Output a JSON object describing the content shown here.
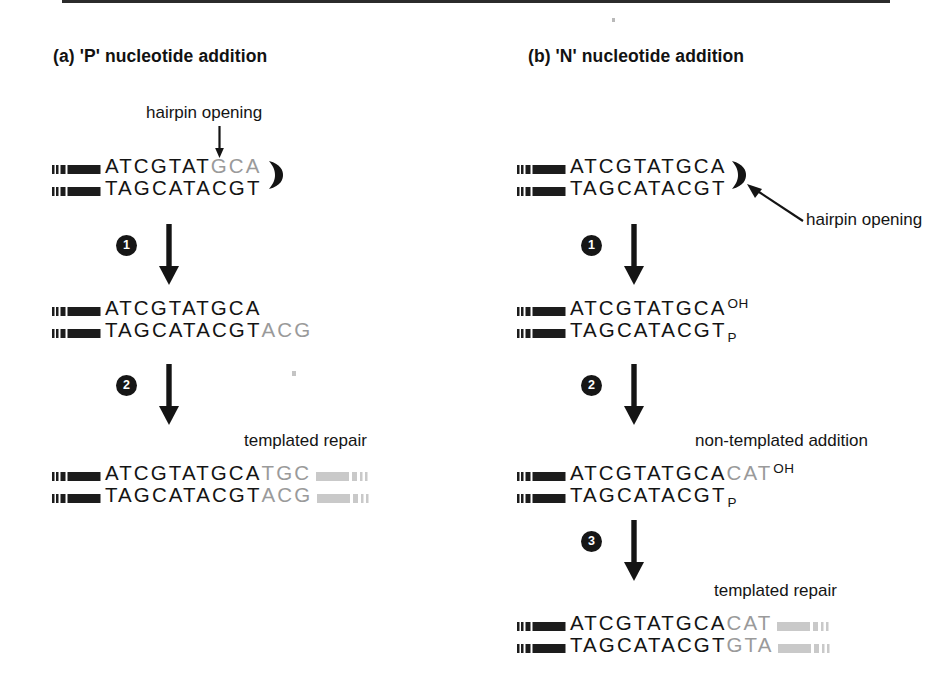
{
  "figure": {
    "background": "#ffffff",
    "ink_black": "#141414",
    "ink_gray": "#9a9a9a",
    "bar_gray": "#c9c9c9"
  },
  "panels": [
    {
      "id": "a",
      "title": "(a)  'P' nucleotide addition",
      "annotations": {
        "hairpin_opening": "hairpin opening",
        "templated_repair": "templated repair"
      },
      "steps": [
        "1",
        "2"
      ],
      "stages": [
        {
          "name": "hairpin-sealed-coding-end",
          "top": {
            "black": "ATCGTAT",
            "gray": "GCA"
          },
          "bottom": {
            "black": "TAGCATACGT",
            "gray": ""
          },
          "hairpin": true,
          "left_bar": true,
          "right_bar": false
        },
        {
          "name": "opened-hairpin-with-p-nucleotides",
          "top": {
            "black": "ATCGTATGCA",
            "gray": ""
          },
          "bottom": {
            "black": "TAGCATACGT",
            "gray": "ACG"
          },
          "hairpin": false,
          "left_bar": true,
          "right_bar": false
        },
        {
          "name": "templated-repair-product",
          "top": {
            "black": "ATCGTATGCA",
            "gray": "TGC"
          },
          "bottom": {
            "black": "TAGCATACGT",
            "gray": "ACG"
          },
          "hairpin": false,
          "left_bar": true,
          "right_bar": true
        }
      ]
    },
    {
      "id": "b",
      "title": "(b)  'N' nucleotide addition",
      "annotations": {
        "hairpin_opening": "hairpin opening",
        "non_templated_addition": "non-templated addition",
        "templated_repair": "templated repair"
      },
      "steps": [
        "1",
        "2",
        "3"
      ],
      "stages": [
        {
          "name": "hairpin-sealed-coding-end",
          "top": {
            "black": "ATCGTATGCA",
            "gray": ""
          },
          "bottom": {
            "black": "TAGCATACGT",
            "gray": ""
          },
          "hairpin": true,
          "left_bar": true,
          "right_bar": false,
          "top_label": "",
          "bottom_label": ""
        },
        {
          "name": "opened-hairpin-blunt-end",
          "top": {
            "black": "ATCGTATGCA",
            "gray": ""
          },
          "bottom": {
            "black": "TAGCATACGT",
            "gray": ""
          },
          "hairpin": false,
          "left_bar": true,
          "right_bar": false,
          "top_label": "OH",
          "bottom_label": "P"
        },
        {
          "name": "non-templated-n-nucleotides-added",
          "top": {
            "black": "ATCGTATGCA",
            "gray": "CAT"
          },
          "bottom": {
            "black": "TAGCATACGT",
            "gray": ""
          },
          "hairpin": false,
          "left_bar": true,
          "right_bar": false,
          "top_label": "OH",
          "bottom_label": "P"
        },
        {
          "name": "templated-repair-product",
          "top": {
            "black": "ATCGTATGCA",
            "gray": "CAT"
          },
          "bottom": {
            "black": "TAGCATACGT",
            "gray": "GTA"
          },
          "hairpin": false,
          "left_bar": true,
          "right_bar": true,
          "top_label": "",
          "bottom_label": ""
        }
      ]
    }
  ]
}
